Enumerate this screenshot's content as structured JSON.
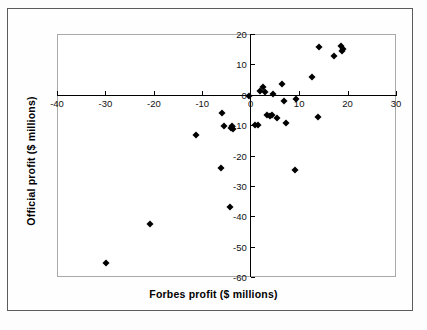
{
  "chart_data": {
    "type": "scatter",
    "title": "",
    "xlabel": "Forbes profit ($ millions)",
    "ylabel": "Official profit ($ millions)",
    "xlim": [
      -40,
      30
    ],
    "ylim": [
      -60,
      20
    ],
    "xticks": [
      -40,
      -30,
      -20,
      -10,
      0,
      10,
      20,
      30
    ],
    "yticks": [
      20,
      10,
      0,
      -10,
      -20,
      -30,
      -40,
      -50,
      -60
    ],
    "xtick_labels": [
      "-40",
      "-30",
      "-20",
      "-10",
      "0",
      "10",
      "20",
      "30"
    ],
    "ytick_labels": [
      "20",
      "10",
      "0",
      "-10",
      "-20",
      "-30",
      "-40",
      "-50",
      "-60"
    ],
    "grid": false,
    "legend": null,
    "marker": "diamond",
    "marker_color": "#000000",
    "points": [
      {
        "x": -29.9,
        "y": -55.5
      },
      {
        "x": -20.8,
        "y": -42.5
      },
      {
        "x": -11.2,
        "y": -13.2
      },
      {
        "x": -6.1,
        "y": -24.0
      },
      {
        "x": -5.9,
        "y": -6.0
      },
      {
        "x": -5.6,
        "y": -10.3
      },
      {
        "x": -4.3,
        "y": -36.8
      },
      {
        "x": -4.1,
        "y": -10.9
      },
      {
        "x": -3.9,
        "y": -10.2
      },
      {
        "x": -3.7,
        "y": -11.4
      },
      {
        "x": -0.3,
        "y": -0.4
      },
      {
        "x": 0.8,
        "y": -9.9
      },
      {
        "x": 1.6,
        "y": -9.8
      },
      {
        "x": 2.0,
        "y": 1.3
      },
      {
        "x": 2.6,
        "y": 2.4
      },
      {
        "x": 3.0,
        "y": 0.9
      },
      {
        "x": 3.4,
        "y": -6.6
      },
      {
        "x": 3.9,
        "y": -7.0
      },
      {
        "x": 4.3,
        "y": -6.8
      },
      {
        "x": 4.6,
        "y": 0.1
      },
      {
        "x": 5.4,
        "y": -7.6
      },
      {
        "x": 6.4,
        "y": 3.4
      },
      {
        "x": 6.9,
        "y": -1.9
      },
      {
        "x": 7.2,
        "y": -9.4
      },
      {
        "x": 9.1,
        "y": -24.9
      },
      {
        "x": 9.3,
        "y": -1.4
      },
      {
        "x": 12.7,
        "y": 6.0
      },
      {
        "x": 13.9,
        "y": -7.4
      },
      {
        "x": 14.2,
        "y": 15.6
      },
      {
        "x": 17.1,
        "y": 12.7
      },
      {
        "x": 18.7,
        "y": 16.0
      },
      {
        "x": 18.9,
        "y": 14.3
      },
      {
        "x": 19.1,
        "y": 14.9
      }
    ]
  },
  "figure": {
    "background_color": "#ffffff",
    "frame_color": "#5b5b5b",
    "plot_border_color": "#a9a9a9",
    "axis_color": "#000000"
  }
}
